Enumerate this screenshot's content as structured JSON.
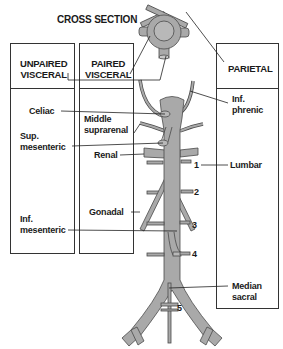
{
  "diagram": {
    "title": "CROSS SECTION",
    "colors": {
      "vessel_fill": "#a9a9a9",
      "vessel_stroke": "#4a4a4a",
      "line": "#222222",
      "background": "#ffffff"
    },
    "categories": {
      "unpaired": "UNPAIRED\nVISCERAL",
      "unpaired_line1": "UNPAIRED",
      "unpaired_line2": "VISCERAL",
      "paired_line1": "PAIRED",
      "paired_line2": "VISCERAL",
      "parietal": "PARIETAL"
    },
    "unpaired_branches": {
      "celiac": "Celiac",
      "sup_mesenteric_1": "Sup.",
      "sup_mesenteric_2": "mesenteric",
      "inf_mesenteric_1": "Inf.",
      "inf_mesenteric_2": "mesenteric"
    },
    "paired_branches": {
      "middle_suprarenal_1": "Middle",
      "middle_suprarenal_2": "suprarenal",
      "renal": "Renal",
      "gonadal": "Gonadal"
    },
    "parietal_branches": {
      "inf_phrenic_1": "Inf.",
      "inf_phrenic_2": "phrenic",
      "lumbar": "Lumbar",
      "median_sacral_1": "Median",
      "median_sacral_2": "sacral"
    },
    "lumbar_numbers": [
      "1",
      "2",
      "3",
      "4",
      "5"
    ]
  }
}
